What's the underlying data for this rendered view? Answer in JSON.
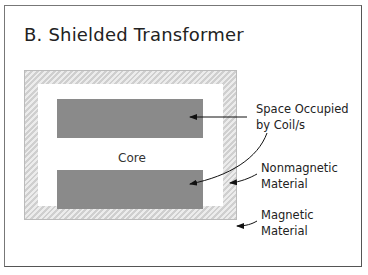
{
  "slide": {
    "title": "B. Shielded Transformer",
    "core_label": "Core",
    "labels": {
      "coil": [
        "Space Occupied",
        "by Coil/s"
      ],
      "nonmagnetic": [
        "Nonmagnetic",
        "Material"
      ],
      "magnetic": [
        "Magnetic",
        "Material"
      ]
    }
  },
  "colors": {
    "coil": "#8a8a8a",
    "hatch_dark": "#cfcfcf",
    "hatch_light": "#ececec",
    "border": "#777777"
  }
}
